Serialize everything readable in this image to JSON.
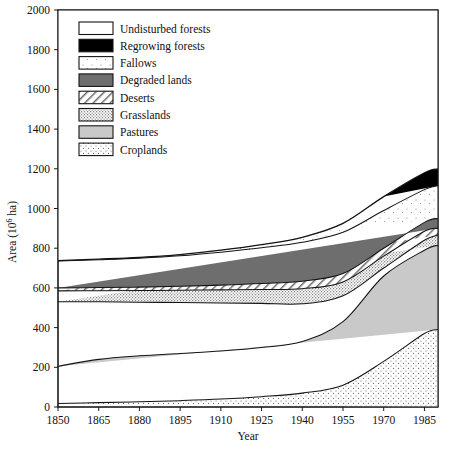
{
  "chart_data": {
    "type": "area",
    "stacked": true,
    "title": "",
    "xlabel": "Year",
    "ylabel": "Area (10^6 ha)",
    "ylabel_base": "Area (10",
    "ylabel_exp": "6",
    "ylabel_tail": " ha)",
    "xlim": [
      1850,
      1990
    ],
    "ylim": [
      0,
      2000
    ],
    "grid": false,
    "x": [
      1850,
      1865,
      1880,
      1895,
      1910,
      1925,
      1940,
      1955,
      1970,
      1985,
      1990
    ],
    "xticks": [
      1850,
      1865,
      1880,
      1895,
      1910,
      1925,
      1940,
      1955,
      1970,
      1985
    ],
    "xtick_labels": [
      "1850",
      "1865",
      "1880",
      "1895",
      "1910",
      "1925",
      "1940",
      "1955",
      "1970",
      "1985"
    ],
    "yticks": [
      0,
      200,
      400,
      600,
      800,
      1000,
      1200,
      1400,
      1600,
      1800,
      2000
    ],
    "ytick_labels": [
      "0",
      "200",
      "400",
      "600",
      "800",
      "1000",
      "1200",
      "1400",
      "1600",
      "1800",
      "2000"
    ],
    "legend_position": "upper-left-inside",
    "stack_order_bottom_to_top": [
      "Croplands",
      "Pastures",
      "Grasslands",
      "Deserts",
      "Degraded lands",
      "Fallows",
      "Regrowing forests",
      "Undisturbed forests"
    ],
    "series": [
      {
        "name": "Croplands",
        "pattern": "stipple-medium",
        "color": "#f0f0f0",
        "cumulative_top": [
          18,
          22,
          26,
          32,
          40,
          52,
          70,
          110,
          230,
          370,
          390
        ]
      },
      {
        "name": "Pastures",
        "pattern": "solid-light-gray",
        "color": "#c9c9c9",
        "cumulative_top": [
          205,
          240,
          258,
          270,
          282,
          300,
          330,
          430,
          660,
          790,
          815
        ]
      },
      {
        "name": "Grasslands",
        "pattern": "stipple-dense",
        "color": "#e4e4e4",
        "cumulative_top": [
          530,
          530,
          528,
          526,
          524,
          522,
          520,
          560,
          700,
          840,
          865
        ]
      },
      {
        "name": "Deserts",
        "pattern": "diagonal-hatch",
        "color": "#ffffff",
        "cumulative_top": [
          585,
          586,
          587,
          588,
          590,
          592,
          596,
          630,
          760,
          885,
          900
        ]
      },
      {
        "name": "Degraded lands",
        "pattern": "solid-dark-gray",
        "color": "#6e6e6e",
        "cumulative_top": [
          600,
          602,
          604,
          608,
          614,
          622,
          634,
          672,
          800,
          930,
          950
        ]
      },
      {
        "name": "Fallows",
        "pattern": "stipple-sparse",
        "color": "#fafafa",
        "cumulative_top": [
          735,
          742,
          750,
          762,
          780,
          802,
          830,
          880,
          990,
          1095,
          1115
        ]
      },
      {
        "name": "Regrowing forests",
        "pattern": "solid-black",
        "color": "#000000",
        "cumulative_top": [
          737,
          745,
          754,
          768,
          790,
          818,
          855,
          925,
          1060,
          1180,
          1200
        ]
      },
      {
        "name": "Undisturbed forests",
        "pattern": "solid-white",
        "color": "#ffffff",
        "cumulative_top": [
          737,
          745,
          754,
          768,
          790,
          818,
          855,
          925,
          1060,
          1180,
          1200
        ]
      }
    ],
    "legend_entries": [
      {
        "label": "Undisturbed forests",
        "pattern": "solid-white"
      },
      {
        "label": "Regrowing forests",
        "pattern": "solid-black"
      },
      {
        "label": "Fallows",
        "pattern": "stipple-sparse"
      },
      {
        "label": "Degraded lands",
        "pattern": "solid-dark-gray"
      },
      {
        "label": "Deserts",
        "pattern": "diagonal-hatch"
      },
      {
        "label": "Grasslands",
        "pattern": "stipple-dense"
      },
      {
        "label": "Pastures",
        "pattern": "solid-light-gray"
      },
      {
        "label": "Croplands",
        "pattern": "stipple-medium"
      }
    ]
  }
}
